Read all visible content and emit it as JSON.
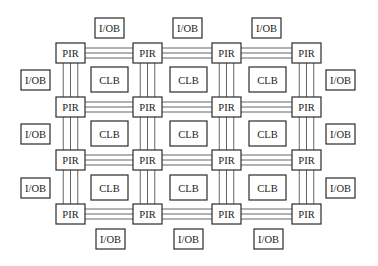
{
  "diagram": {
    "title": "",
    "pir_label": "PIR",
    "clb_label": "CLB",
    "iob_label": "I/OB",
    "pir": {
      "cols": [
        56,
        133,
        212,
        292
      ],
      "rows": [
        43,
        97,
        150,
        204
      ],
      "w": 29,
      "h": 20
    },
    "clb": {
      "cols": [
        91,
        170,
        249
      ],
      "rows": [
        67,
        121,
        175
      ],
      "w": 37,
      "h": 25
    },
    "iob": {
      "w": 29,
      "h": 20,
      "top": [
        [
          95,
          18
        ],
        [
          173,
          18
        ],
        [
          252,
          18
        ]
      ],
      "bottom": [
        [
          96,
          229
        ],
        [
          174,
          229
        ],
        [
          254,
          229
        ]
      ],
      "left": [
        [
          21,
          70
        ],
        [
          21,
          124
        ],
        [
          21,
          178
        ]
      ],
      "right": [
        [
          326,
          70
        ],
        [
          326,
          124
        ],
        [
          326,
          178
        ]
      ]
    },
    "wires_per_channel": 3
  }
}
